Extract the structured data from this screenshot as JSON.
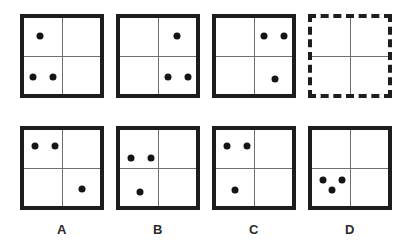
{
  "puzzle": {
    "type": "visual-analogy-matrix",
    "title": "Dot pattern sequence puzzle",
    "dot_diameter_px": 7,
    "colors": {
      "border": "#1d1d1d",
      "grid_line": "#6e6e6e",
      "dot": "#151515",
      "background": "#ffffff",
      "label": "#2b2b2b"
    },
    "sequence_row": {
      "name": "sequence",
      "panels": [
        {
          "id": "seq-1",
          "border_style": "solid",
          "x": 20,
          "y": 14,
          "size": 84,
          "dots": [
            {
              "cx": 20,
              "cy": 22,
              "quadrant": "upper-left"
            },
            {
              "cx": 13,
              "cy": 63,
              "quadrant": "lower-left"
            },
            {
              "cx": 33,
              "cy": 63,
              "quadrant": "lower-left"
            }
          ]
        },
        {
          "id": "seq-2",
          "border_style": "solid",
          "x": 116,
          "y": 14,
          "size": 84,
          "dots": [
            {
              "cx": 61,
              "cy": 22,
              "quadrant": "upper-right"
            },
            {
              "cx": 52,
              "cy": 63,
              "quadrant": "lower-right"
            },
            {
              "cx": 72,
              "cy": 63,
              "quadrant": "lower-right"
            }
          ]
        },
        {
          "id": "seq-3",
          "border_style": "solid",
          "x": 212,
          "y": 14,
          "size": 84,
          "dots": [
            {
              "cx": 52,
              "cy": 22,
              "quadrant": "upper-right"
            },
            {
              "cx": 72,
              "cy": 22,
              "quadrant": "upper-right"
            },
            {
              "cx": 63,
              "cy": 65,
              "quadrant": "lower-right"
            }
          ]
        },
        {
          "id": "seq-4-answer-slot",
          "border_style": "dashed",
          "x": 308,
          "y": 14,
          "size": 84,
          "dots": []
        }
      ]
    },
    "options_row": {
      "name": "answer-options",
      "panels": [
        {
          "id": "option-a",
          "label": "A",
          "border_style": "solid",
          "x": 20,
          "y": 126,
          "size": 84,
          "dots": [
            {
              "cx": 15,
              "cy": 20,
              "quadrant": "upper-left"
            },
            {
              "cx": 35,
              "cy": 20,
              "quadrant": "upper-left"
            },
            {
              "cx": 62,
              "cy": 63,
              "quadrant": "lower-right"
            }
          ]
        },
        {
          "id": "option-b",
          "label": "B",
          "border_style": "solid",
          "x": 116,
          "y": 126,
          "size": 84,
          "dots": [
            {
              "cx": 15,
              "cy": 32,
              "quadrant": "upper-left"
            },
            {
              "cx": 35,
              "cy": 32,
              "quadrant": "upper-left"
            },
            {
              "cx": 24,
              "cy": 66,
              "quadrant": "lower-left"
            }
          ]
        },
        {
          "id": "option-c",
          "label": "C",
          "border_style": "solid",
          "x": 212,
          "y": 126,
          "size": 84,
          "dots": [
            {
              "cx": 15,
              "cy": 20,
              "quadrant": "upper-left"
            },
            {
              "cx": 35,
              "cy": 20,
              "quadrant": "upper-left"
            },
            {
              "cx": 23,
              "cy": 64,
              "quadrant": "lower-left"
            }
          ]
        },
        {
          "id": "option-d",
          "label": "D",
          "border_style": "solid",
          "x": 308,
          "y": 126,
          "size": 84,
          "dots": [
            {
              "cx": 15,
              "cy": 54,
              "quadrant": "lower-left"
            },
            {
              "cx": 34,
              "cy": 54,
              "quadrant": "lower-left"
            },
            {
              "cx": 24,
              "cy": 64,
              "quadrant": "lower-left"
            }
          ]
        }
      ],
      "labels": [
        {
          "text": "A",
          "x": 20,
          "y": 222,
          "width": 84
        },
        {
          "text": "B",
          "x": 116,
          "y": 222,
          "width": 84
        },
        {
          "text": "C",
          "x": 212,
          "y": 222,
          "width": 84
        },
        {
          "text": "D",
          "x": 308,
          "y": 222,
          "width": 84
        }
      ]
    }
  }
}
